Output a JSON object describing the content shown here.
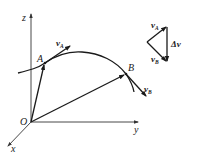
{
  "figure": {
    "type": "physics-kinematics-diagram"
  },
  "axes": {
    "origin_label": "O",
    "x_label": "x",
    "y_label": "y",
    "z_label": "z"
  },
  "points": {
    "A": {
      "label": "A"
    },
    "B": {
      "label": "B"
    }
  },
  "vectors": {
    "velocity_A": {
      "symbol": "v",
      "subscript": "A",
      "subscript_legible": false
    },
    "velocity_B": {
      "symbol": "v",
      "subscript": "B",
      "subscript_legible": false
    },
    "position_A": {
      "from": "O",
      "to": "A"
    },
    "position_B": {
      "from": "O",
      "to": "B"
    }
  },
  "vector_triangle": {
    "top_label": {
      "symbol": "v",
      "subscript": "A",
      "subscript_legible": false
    },
    "bottom_label": {
      "symbol": "v",
      "subscript": "B",
      "subscript_legible": false
    },
    "delta_label": "Δv"
  },
  "colors": {
    "ink": "#1a1a1a",
    "axis": "#333333",
    "background": "#ffffff"
  }
}
